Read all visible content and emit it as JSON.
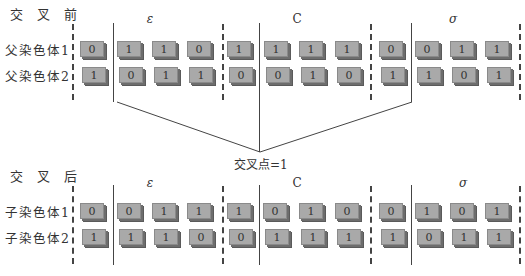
{
  "before": {
    "title": "交 叉 前",
    "rows": [
      {
        "label": "父染色体1",
        "bits": [
          "0",
          "1",
          "1",
          "0",
          "1",
          "1",
          "1",
          "1",
          "0",
          "0",
          "1",
          "1"
        ]
      },
      {
        "label": "父染色体2",
        "bits": [
          "1",
          "0",
          "1",
          "1",
          "0",
          "0",
          "1",
          "0",
          "1",
          "1",
          "0",
          "1"
        ]
      }
    ]
  },
  "after": {
    "title": "交 叉 后",
    "rows": [
      {
        "label": "子染色体1",
        "bits": [
          "0",
          "0",
          "1",
          "1",
          "1",
          "0",
          "1",
          "0",
          "0",
          "1",
          "0",
          "1"
        ]
      },
      {
        "label": "子染色体2",
        "bits": [
          "1",
          "1",
          "1",
          "0",
          "0",
          "1",
          "1",
          "1",
          "1",
          "0",
          "1",
          "1"
        ]
      }
    ]
  },
  "genes": {
    "g1": "ε",
    "g2": "C",
    "g3": "σ"
  },
  "crossover": {
    "label": "交叉点=1"
  },
  "colors": {
    "tile": "#a9a9a9",
    "tile_shadow": "#6d6d6d",
    "line": "#444444"
  }
}
